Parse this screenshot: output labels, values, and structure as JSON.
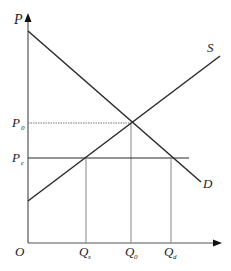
{
  "diagram": {
    "type": "supply-demand",
    "axes": {
      "y_label": "P",
      "origin_label": "O"
    },
    "curves": {
      "supply_label": "S",
      "demand_label": "D"
    },
    "price_labels": {
      "equilibrium": "P",
      "equilibrium_sub": "0",
      "ceiling": "P",
      "ceiling_sub": "c"
    },
    "quantity_labels": {
      "supplied": "Q",
      "supplied_sub": "s",
      "equilibrium": "Q",
      "equilibrium_sub": "0",
      "demanded": "Q",
      "demanded_sub": "d"
    },
    "colors": {
      "line": "#2a2a2a",
      "guide": "#777777"
    }
  }
}
